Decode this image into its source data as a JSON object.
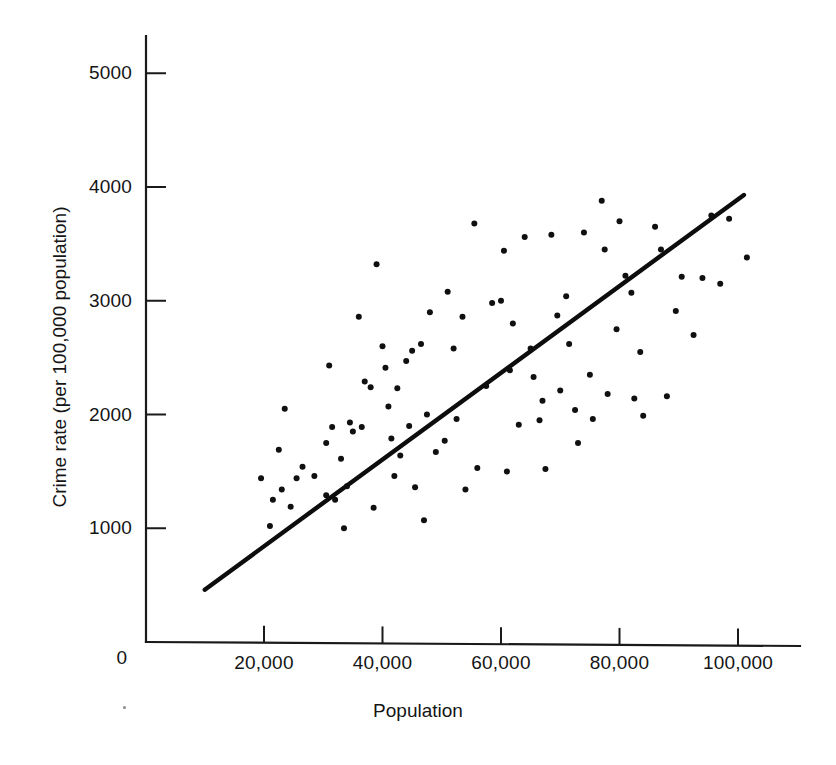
{
  "figure": {
    "title": "",
    "background_color": "#ffffff",
    "ink_color": "#101010"
  },
  "axes": {
    "x_title": "Population",
    "y_title": "Crime rate (per 100,000 population)",
    "x_tick_labels": [
      "0",
      "20,000",
      "40,000",
      "60,000",
      "80,000",
      "100,000"
    ],
    "y_tick_labels": [
      "1000",
      "2000",
      "3000",
      "4000",
      "5000"
    ]
  },
  "chart_data": {
    "type": "scatter",
    "title": "",
    "xlabel": "Population",
    "ylabel": "Crime rate (per 100,000 population)",
    "xlim": [
      0,
      108000
    ],
    "ylim": [
      0,
      5400
    ],
    "xticks": [
      0,
      20000,
      40000,
      60000,
      80000,
      100000
    ],
    "xticklabels": [
      "0",
      "20,000",
      "40,000",
      "60,000",
      "80,000",
      "100,000"
    ],
    "yticks": [
      1000,
      2000,
      3000,
      4000,
      5000
    ],
    "yticklabels": [
      "1000",
      "2000",
      "3000",
      "4000",
      "5000"
    ],
    "grid": false,
    "legend": false,
    "marker": "filled-circle",
    "marker_color": "#101010",
    "marker_size_px": 6,
    "points": [
      [
        19500,
        1440
      ],
      [
        21000,
        1020
      ],
      [
        21500,
        1250
      ],
      [
        22500,
        1690
      ],
      [
        23000,
        1340
      ],
      [
        23500,
        2050
      ],
      [
        24500,
        1190
      ],
      [
        25500,
        1440
      ],
      [
        26500,
        1540
      ],
      [
        28500,
        1460
      ],
      [
        30500,
        1750
      ],
      [
        30500,
        1290
      ],
      [
        31000,
        2430
      ],
      [
        31500,
        1890
      ],
      [
        32000,
        1250
      ],
      [
        33000,
        1610
      ],
      [
        33500,
        1000
      ],
      [
        34000,
        1370
      ],
      [
        34500,
        1930
      ],
      [
        35000,
        1850
      ],
      [
        36000,
        2860
      ],
      [
        36500,
        1890
      ],
      [
        37000,
        2290
      ],
      [
        38000,
        2240
      ],
      [
        38500,
        1180
      ],
      [
        39000,
        3320
      ],
      [
        40000,
        2600
      ],
      [
        40500,
        2410
      ],
      [
        41000,
        2070
      ],
      [
        41500,
        1790
      ],
      [
        42000,
        1460
      ],
      [
        42500,
        2230
      ],
      [
        43000,
        1640
      ],
      [
        44000,
        2470
      ],
      [
        44500,
        1900
      ],
      [
        45000,
        2560
      ],
      [
        45500,
        1360
      ],
      [
        46500,
        2620
      ],
      [
        47000,
        1070
      ],
      [
        47500,
        2000
      ],
      [
        48000,
        2900
      ],
      [
        49000,
        1670
      ],
      [
        50500,
        1770
      ],
      [
        51000,
        3080
      ],
      [
        52000,
        2580
      ],
      [
        52500,
        1960
      ],
      [
        53500,
        2860
      ],
      [
        54000,
        1340
      ],
      [
        55500,
        3680
      ],
      [
        56000,
        1530
      ],
      [
        57500,
        2250
      ],
      [
        58500,
        2980
      ],
      [
        60000,
        3000
      ],
      [
        60500,
        3440
      ],
      [
        61000,
        1500
      ],
      [
        61500,
        2390
      ],
      [
        62000,
        2800
      ],
      [
        63000,
        1910
      ],
      [
        64000,
        3560
      ],
      [
        65000,
        2580
      ],
      [
        65500,
        2330
      ],
      [
        66500,
        1950
      ],
      [
        67000,
        2120
      ],
      [
        67500,
        1520
      ],
      [
        68500,
        3580
      ],
      [
        69500,
        2870
      ],
      [
        70000,
        2210
      ],
      [
        71000,
        3040
      ],
      [
        71500,
        2620
      ],
      [
        72500,
        2040
      ],
      [
        73000,
        1750
      ],
      [
        74000,
        3600
      ],
      [
        75000,
        2350
      ],
      [
        75500,
        1960
      ],
      [
        77000,
        3880
      ],
      [
        77500,
        3450
      ],
      [
        78000,
        2180
      ],
      [
        79500,
        2750
      ],
      [
        80000,
        3700
      ],
      [
        81000,
        3220
      ],
      [
        82000,
        3070
      ],
      [
        82500,
        2140
      ],
      [
        83500,
        2550
      ],
      [
        84000,
        1990
      ],
      [
        86000,
        3650
      ],
      [
        87000,
        3450
      ],
      [
        88000,
        2160
      ],
      [
        89500,
        2910
      ],
      [
        90500,
        3210
      ],
      [
        92500,
        2700
      ],
      [
        94000,
        3200
      ],
      [
        95500,
        3750
      ],
      [
        97000,
        3150
      ],
      [
        98500,
        3720
      ],
      [
        101500,
        3380
      ]
    ],
    "fit_line": {
      "label": "least-squares regression line",
      "x_start": 10000,
      "y_start": 460,
      "x_end": 101000,
      "y_end": 3930
    }
  }
}
